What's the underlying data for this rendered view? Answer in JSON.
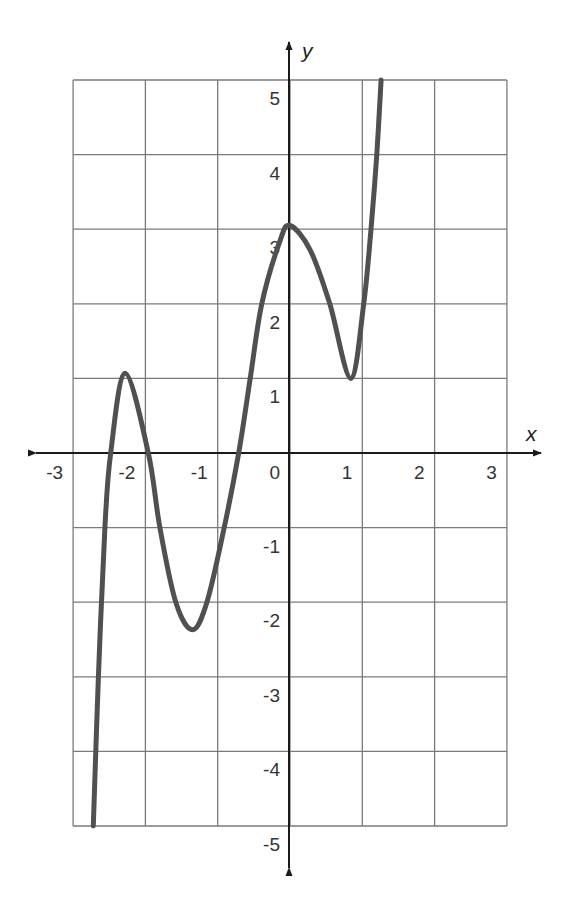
{
  "chart_data": {
    "type": "line",
    "title": "",
    "xlabel": "x",
    "ylabel": "y",
    "xlim": [
      -3,
      3
    ],
    "ylim": [
      -5,
      5
    ],
    "grid": true,
    "legend": null,
    "x_ticks": [
      "-3",
      "-2",
      "-1",
      "0",
      "1",
      "2",
      "3"
    ],
    "y_ticks": [
      "5",
      "4",
      "3",
      "2",
      "1",
      "-1",
      "-2",
      "-3",
      "-4",
      "-5"
    ],
    "series": [
      {
        "name": "f(x)",
        "description": "polynomial curve with local max ~(-2.25, 1.1), local min ~(-1.35, -2.35), local max ~(0.05, 3.05), local min ~(0.85, 1.0)",
        "points": [
          [
            -2.72,
            -5.0
          ],
          [
            -2.65,
            -3.0
          ],
          [
            -2.56,
            -1.0
          ],
          [
            -2.48,
            0.0
          ],
          [
            -2.28,
            1.07
          ],
          [
            -1.96,
            0.0
          ],
          [
            -1.8,
            -1.0
          ],
          [
            -1.58,
            -2.0
          ],
          [
            -1.35,
            -2.37
          ],
          [
            -1.15,
            -2.0
          ],
          [
            -0.91,
            -1.0
          ],
          [
            -0.71,
            0.0
          ],
          [
            -0.55,
            1.0
          ],
          [
            -0.39,
            2.0
          ],
          [
            -0.14,
            2.84
          ],
          [
            0.0,
            3.05
          ],
          [
            0.28,
            2.72
          ],
          [
            0.55,
            2.0
          ],
          [
            0.84,
            1.0
          ],
          [
            1.02,
            2.0
          ],
          [
            1.12,
            3.0
          ],
          [
            1.2,
            4.0
          ],
          [
            1.26,
            5.0
          ]
        ]
      }
    ],
    "colors": {
      "curve": "#505050",
      "grid": "#7a7a7a",
      "axis": "#1a1a1a"
    }
  }
}
